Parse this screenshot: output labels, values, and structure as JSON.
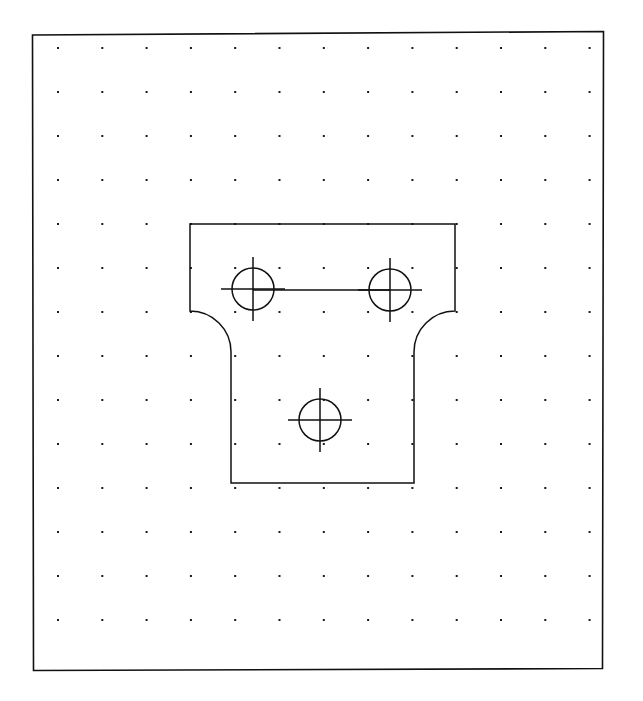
{
  "document": {
    "kind": "cad-sketch",
    "title": "Bracket Plate Sketch",
    "page_width": 643,
    "page_height": 701,
    "background_color": "#ffffff",
    "line_color": "#111111",
    "grid_dot_color": "#1a1a1a"
  },
  "viewport": {
    "border_label": "Drawing Border",
    "border": {
      "x": 32,
      "y": 32,
      "width": 571,
      "height": 638
    },
    "border_stroke_width": 1.6,
    "skew_note": "scanned page, border very slightly rotated"
  },
  "grid": {
    "label": "Snap Grid",
    "visible": true,
    "dot_size": 2,
    "origin_x": 58,
    "origin_y": 48,
    "spacing_x": 44.3,
    "spacing_y": 44.0,
    "columns": 13,
    "rows": 14,
    "color": "#1a1a1a"
  },
  "part": {
    "label": "Bracket Outline",
    "stroke_width": 1.5,
    "stroke_color": "#111111",
    "fill": "none",
    "geometry": {
      "flange_left_x": 190,
      "flange_right_x": 455,
      "flange_top_y": 224,
      "flange_bottom_y": 311,
      "web_left_x": 231,
      "web_right_x": 414,
      "web_bottom_y": 483,
      "fillet_radius": 41,
      "fillet_left_start": {
        "x": 190,
        "y": 311
      },
      "fillet_left_end": {
        "x": 231,
        "y": 352
      },
      "fillet_right_start": {
        "x": 455,
        "y": 311
      },
      "fillet_right_end": {
        "x": 414,
        "y": 352
      }
    }
  },
  "holes": [
    {
      "name": "hole-upper-left",
      "cx": 253,
      "cy": 289,
      "r": 21,
      "centermark_extension": 11,
      "label": "Upper Left Hole"
    },
    {
      "name": "hole-upper-right",
      "cx": 390,
      "cy": 290,
      "r": 21,
      "centermark_extension": 11,
      "label": "Upper Right Hole"
    },
    {
      "name": "hole-lower-center",
      "cx": 320,
      "cy": 420,
      "r": 21,
      "centermark_extension": 11,
      "label": "Lower Center Hole"
    }
  ],
  "construction_lines": [
    {
      "name": "hole-centerline-link",
      "label": "Centerline Between Upper Holes",
      "x1": 253,
      "y1": 290,
      "x2": 390,
      "y2": 290,
      "stroke_width": 1.5
    }
  ],
  "icons": {
    "grid_dot": "grid-dot-icon",
    "center_mark": "center-mark-icon"
  }
}
